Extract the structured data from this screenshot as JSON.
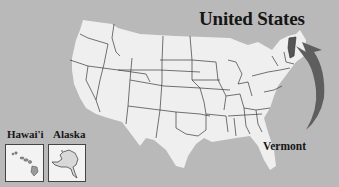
{
  "title": "United States",
  "highlighted_state": "Vermont",
  "callout_label": "Vermont",
  "insets": [
    {
      "label": "Hawai'i"
    },
    {
      "label": "Alaska"
    }
  ],
  "colors": {
    "background": "#b9b9b9",
    "land": "#efefef",
    "borders": "#3a3a3a",
    "highlight": "#555555",
    "arrow": "#5e5e5e"
  }
}
